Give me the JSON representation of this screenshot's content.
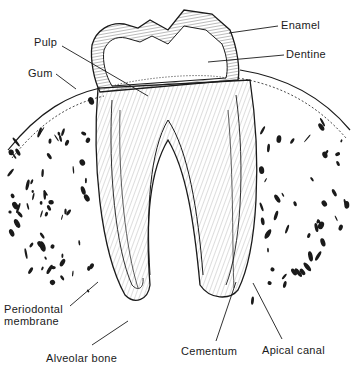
{
  "diagram": {
    "colors": {
      "ink": "#1a1a1a",
      "paper": "#ffffff"
    },
    "labels": [
      {
        "id": "pulp",
        "text": "Pulp",
        "x": 34,
        "y": 36,
        "line": [
          62,
          46,
          148,
          96
        ]
      },
      {
        "id": "gum",
        "text": "Gum",
        "x": 28,
        "y": 67,
        "line": [
          56,
          74,
          76,
          89
        ]
      },
      {
        "id": "enamel",
        "text": "Enamel",
        "x": 281,
        "y": 19,
        "line": [
          278,
          26,
          229,
          33
        ]
      },
      {
        "id": "dentine",
        "text": "Dentine",
        "x": 286,
        "y": 48,
        "line": [
          284,
          55,
          208,
          62
        ]
      },
      {
        "id": "periodontal-membrane",
        "text": "Periodontal",
        "text2": "membrane",
        "x": 4,
        "y": 303,
        "line": [
          70,
          306,
          98,
          282
        ]
      },
      {
        "id": "alveolar-bone",
        "text": "Alveolar bone",
        "x": 46,
        "y": 352,
        "line": [
          92,
          345,
          128,
          321
        ]
      },
      {
        "id": "cementum",
        "text": "Cementum",
        "x": 181,
        "y": 345,
        "line": [
          216,
          341,
          236,
          282
        ]
      },
      {
        "id": "apical-canal",
        "text": "Apical canal",
        "x": 262,
        "y": 344,
        "line": [
          282,
          339,
          253,
          283
        ]
      }
    ]
  }
}
